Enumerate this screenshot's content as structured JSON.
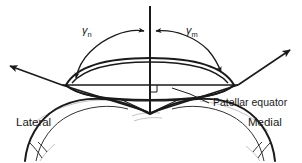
{
  "figure": {
    "background_color": "#ffffff",
    "ink_color": "#1a1a1a",
    "shadow_color": "#aaaaaa",
    "width": 302,
    "height": 163
  },
  "labels": {
    "gamma_n_symbol": "γ",
    "gamma_n_subscript": "n",
    "gamma_m_symbol": "γ",
    "gamma_m_subscript": "m",
    "patellar_equator": "Patellar equator",
    "lateral": "Lateral",
    "medial": "Medial"
  },
  "annotations": {
    "vertical_axis": "vertical reference axis",
    "left_arrow": "lateral patellar facet vector",
    "right_arrow": "medial patellar facet vector",
    "left_arc": "arc measuring gamma n from vertical axis",
    "right_arc": "arc measuring gamma m from vertical axis",
    "right_angle_marker": "perpendicular marker at axis intersection"
  },
  "anatomy": {
    "patella": "patella cross-section (lens shape)",
    "equator_line": "patellar equator chord",
    "femoral_condyles": "femoral condyle outline with trochlear groove"
  }
}
